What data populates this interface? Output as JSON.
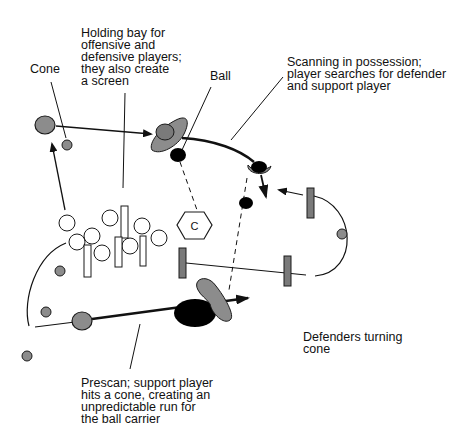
{
  "diagram": {
    "labels": {
      "cone": "Cone",
      "holding_bay": "Holding bay for\noffensive and\ndefensive players;\nthey also create\na screen",
      "ball": "Ball",
      "scanning": "Scanning in possession;\nplayer searches for defender\nand support player",
      "defenders_turning": "Defenders turning\ncone",
      "prescan": "Prescan; support player\nhits a cone, creating an\nunpredictable run for\nthe ball carrier"
    },
    "markers": {
      "hexagon_letter": "C"
    },
    "colors": {
      "player_gray": "#8c8c8c",
      "ball_black": "#000000",
      "outline": "#1a1a1a",
      "screen_fill": "#ffffff"
    }
  }
}
